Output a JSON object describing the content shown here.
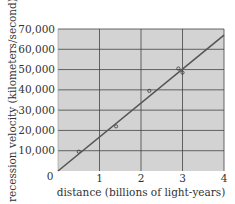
{
  "chart_data": {
    "type": "scatter",
    "title": "",
    "xlabel": "distance (billions of light-years)",
    "ylabel": "recession velocity (kilometers/second)",
    "xlim": [
      0,
      4
    ],
    "ylim": [
      0,
      70000
    ],
    "x_ticks": [
      "0",
      "1",
      "2",
      "3",
      "4"
    ],
    "y_ticks": [
      "10,000",
      "20,000",
      "30,000",
      "40,000",
      "50,000",
      "60,000",
      "70,000"
    ],
    "grid": true,
    "series": [
      {
        "name": "galaxies",
        "kind": "points",
        "x": [
          0.5,
          1.4,
          2.2,
          2.9,
          3.0
        ],
        "y": [
          9500,
          22000,
          39500,
          50500,
          48500
        ]
      },
      {
        "name": "fit line",
        "kind": "line",
        "x": [
          0,
          4
        ],
        "y": [
          0,
          67000
        ]
      }
    ]
  },
  "colors": {
    "plot_bg": "#d3d3d3",
    "grid": "#444444",
    "line": "#555555",
    "text": "#333333"
  }
}
